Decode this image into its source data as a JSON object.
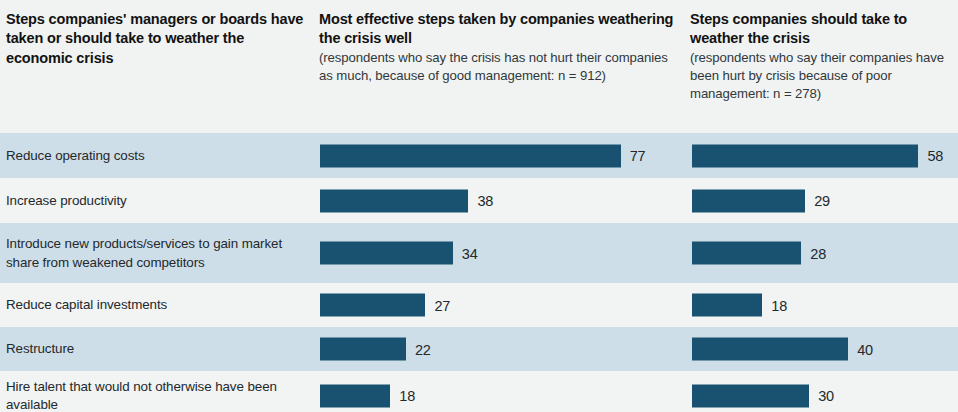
{
  "header": {
    "col1": {
      "title": "Steps companies' managers or boards have taken or should take to weather the economic crisis",
      "subtitle": ""
    },
    "col2": {
      "title": "Most effective steps taken by companies weathering the crisis well",
      "subtitle": "(respondents who say the crisis has not hurt their companies as much, because of good management: n = 912)"
    },
    "col3": {
      "title": "Steps companies should take to weather the crisis",
      "subtitle": "(respondents who say their companies have been hurt by crisis because of poor management: n = 278)"
    }
  },
  "colors": {
    "bar": "#185270",
    "band_shaded": "#cedee8",
    "band_light": "#f1f4f3",
    "text": "#23292d"
  },
  "chart_data": {
    "type": "bar",
    "title": "Steps companies' managers or boards have taken or should take to weather the economic crisis",
    "xlabel": "",
    "ylabel": "",
    "xlim": [
      0,
      80
    ],
    "grid": false,
    "legend": "none",
    "orientation": "horizontal",
    "unit": "% of respondents",
    "categories": [
      "Reduce operating costs",
      "Increase productivity",
      "Introduce new products/services to gain market share from weakened competitors",
      "Reduce capital investments",
      "Restructure",
      "Hire talent that would not otherwise have been available"
    ],
    "series": [
      {
        "name": "Most effective steps taken by companies weathering the crisis well",
        "n": 912,
        "values": [
          77,
          38,
          34,
          27,
          22,
          18
        ],
        "labels": [
          "77",
          "38",
          "34",
          "27",
          "22",
          "18"
        ]
      },
      {
        "name": "Steps companies should take to weather the crisis",
        "n": 278,
        "values": [
          58,
          29,
          28,
          18,
          40,
          30
        ],
        "labels": [
          "58",
          "29",
          "28",
          "18",
          "40",
          "30"
        ]
      }
    ]
  }
}
